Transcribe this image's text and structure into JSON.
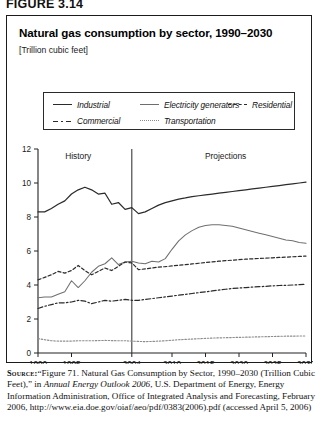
{
  "figure": {
    "label": "FIGURE 3.14"
  },
  "chart": {
    "title": "Natural gas consumption by sector, 1990–2030",
    "units": "[Trillion cubic feet]",
    "era_history": "History",
    "era_projections": "Projections"
  },
  "legend": {
    "items": [
      {
        "label": "Industrial",
        "style": "solid-dark",
        "color": "#2b2b2b"
      },
      {
        "label": "Electricity generators",
        "style": "solid-light",
        "color": "#6f6f6f"
      },
      {
        "label": "Residential",
        "style": "dashed",
        "color": "#2b2b2b"
      },
      {
        "label": "Commercial",
        "style": "dashdot",
        "color": "#2b2b2b"
      },
      {
        "label": "Transportation",
        "style": "dotted",
        "color": "#8d8d8d"
      }
    ]
  },
  "source": {
    "prefix": "Source:",
    "part1": "“Figure 71. Natural Gas Consumption by Sector, 1990–2030 (Trillion Cubic Feet),” in ",
    "italic": "Annual Energy Outlook 2006",
    "part2": ", U.S. Department of Energy, Energy Information Administration, Office of Integrated Analysis and Forecasting, February 2006, http://www.eia.doe.gov/oiaf/aeo/pdf/0383(2006).pdf (accessed April 5, 2006)"
  },
  "chart_data": {
    "type": "line",
    "title": "Natural gas consumption by sector, 1990–2030",
    "xlabel": "",
    "ylabel": "Trillion cubic feet",
    "xlim": [
      1990,
      2030
    ],
    "ylim": [
      0,
      12
    ],
    "grid": false,
    "legend_position": "top",
    "xticks": [
      1990,
      1995,
      2004,
      2010,
      2015,
      2020,
      2025,
      2030
    ],
    "yticks": [
      0,
      2,
      4,
      6,
      8,
      10,
      12
    ],
    "annotations": [
      {
        "text": "History",
        "x": 1996,
        "y": 11.4
      },
      {
        "text": "Projections",
        "x": 2018,
        "y": 11.4
      },
      {
        "text": "divider",
        "x": 2004,
        "type": "vline"
      }
    ],
    "x": [
      1990,
      1991,
      1992,
      1993,
      1994,
      1995,
      1996,
      1997,
      1998,
      1999,
      2000,
      2001,
      2002,
      2003,
      2004,
      2005,
      2006,
      2007,
      2008,
      2009,
      2010,
      2011,
      2012,
      2013,
      2014,
      2015,
      2016,
      2017,
      2018,
      2019,
      2020,
      2021,
      2022,
      2023,
      2024,
      2025,
      2026,
      2027,
      2028,
      2029,
      2030
    ],
    "series": [
      {
        "name": "Industrial",
        "style": "solid",
        "color": "#2b2b2b",
        "values": [
          8.3,
          8.3,
          8.5,
          8.75,
          8.95,
          9.35,
          9.6,
          9.75,
          9.6,
          9.35,
          9.4,
          8.75,
          8.85,
          8.45,
          8.55,
          8.2,
          8.3,
          8.5,
          8.7,
          8.85,
          8.95,
          9.05,
          9.12,
          9.2,
          9.25,
          9.3,
          9.35,
          9.4,
          9.45,
          9.5,
          9.55,
          9.6,
          9.65,
          9.7,
          9.75,
          9.8,
          9.85,
          9.9,
          9.95,
          10.0,
          10.05
        ]
      },
      {
        "name": "Electricity generators",
        "style": "solid",
        "color": "#6f6f6f",
        "values": [
          3.25,
          3.3,
          3.3,
          3.45,
          3.6,
          4.25,
          3.85,
          4.25,
          4.75,
          5.1,
          5.25,
          5.6,
          5.2,
          5.35,
          5.4,
          5.3,
          5.25,
          5.4,
          5.35,
          5.55,
          6.1,
          6.6,
          6.95,
          7.2,
          7.4,
          7.5,
          7.55,
          7.55,
          7.5,
          7.45,
          7.35,
          7.25,
          7.15,
          7.05,
          6.95,
          6.85,
          6.75,
          6.65,
          6.6,
          6.5,
          6.45
        ]
      },
      {
        "name": "Residential",
        "style": "dashed",
        "color": "#2b2b2b",
        "values": [
          4.3,
          4.45,
          4.6,
          4.8,
          4.7,
          4.85,
          5.15,
          4.85,
          4.6,
          4.8,
          5.0,
          4.85,
          5.1,
          5.35,
          5.3,
          4.9,
          4.95,
          5.0,
          5.05,
          5.08,
          5.12,
          5.16,
          5.2,
          5.24,
          5.28,
          5.32,
          5.36,
          5.4,
          5.43,
          5.46,
          5.49,
          5.52,
          5.54,
          5.56,
          5.58,
          5.6,
          5.62,
          5.64,
          5.66,
          5.68,
          5.7
        ]
      },
      {
        "name": "Commercial",
        "style": "dashdot",
        "color": "#2b2b2b",
        "values": [
          2.62,
          2.75,
          2.85,
          2.95,
          2.95,
          3.0,
          3.1,
          3.05,
          2.9,
          3.0,
          3.1,
          3.05,
          3.1,
          3.15,
          3.1,
          3.1,
          3.15,
          3.2,
          3.25,
          3.3,
          3.35,
          3.4,
          3.45,
          3.5,
          3.55,
          3.6,
          3.65,
          3.7,
          3.75,
          3.8,
          3.82,
          3.85,
          3.88,
          3.9,
          3.92,
          3.95,
          3.97,
          3.98,
          4.0,
          4.02,
          4.05
        ]
      },
      {
        "name": "Transportation",
        "style": "dotted",
        "color": "#8d8d8d",
        "values": [
          0.85,
          0.78,
          0.72,
          0.7,
          0.7,
          0.7,
          0.72,
          0.72,
          0.72,
          0.73,
          0.74,
          0.73,
          0.72,
          0.72,
          0.7,
          0.68,
          0.67,
          0.68,
          0.7,
          0.72,
          0.75,
          0.78,
          0.8,
          0.82,
          0.84,
          0.86,
          0.88,
          0.89,
          0.9,
          0.91,
          0.92,
          0.93,
          0.94,
          0.95,
          0.96,
          0.97,
          0.98,
          0.99,
          0.99,
          1.0,
          1.0
        ]
      }
    ]
  }
}
